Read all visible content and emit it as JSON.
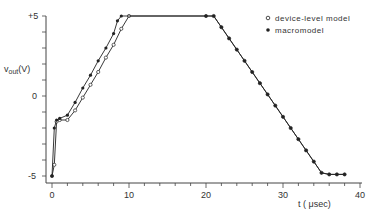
{
  "chart_data": {
    "type": "line",
    "title": "",
    "xlabel": "t (μsec)",
    "ylabel": "v_out(V)",
    "xlim": [
      0,
      40
    ],
    "ylim": [
      -5,
      5
    ],
    "x_ticks": [
      0,
      10,
      20,
      30,
      40
    ],
    "x_tick_labels": [
      "0",
      "10",
      "20",
      "30",
      "40"
    ],
    "y_ticks": [
      -5,
      0,
      5
    ],
    "y_tick_labels": [
      "-5",
      "0",
      "+5"
    ],
    "grid": false,
    "legend_position": "upper right",
    "series": [
      {
        "name": "device-level model",
        "marker": "open-circle",
        "x": [
          0,
          0.3,
          0.6,
          1,
          2,
          3,
          4,
          5,
          6,
          7,
          8,
          9,
          10,
          20,
          21,
          22,
          23,
          24,
          25,
          26,
          27,
          28,
          29,
          30,
          31,
          32,
          33,
          34,
          35,
          36,
          37,
          38
        ],
        "y": [
          -5,
          -4.3,
          -1.6,
          -1.5,
          -1.5,
          -0.9,
          -0.1,
          0.7,
          1.5,
          2.4,
          3.2,
          4.2,
          5,
          5,
          5,
          4.3,
          3.6,
          2.9,
          2.2,
          1.5,
          0.8,
          0.1,
          -0.6,
          -1.3,
          -2.0,
          -2.7,
          -3.4,
          -4.1,
          -4.8,
          -4.9,
          -4.9,
          -4.9
        ]
      },
      {
        "name": "macromodel",
        "marker": "filled-circle",
        "x": [
          0,
          0.3,
          0.6,
          1,
          2,
          3,
          4,
          5,
          6,
          7,
          8,
          8.5,
          9,
          20,
          21,
          22,
          23,
          24,
          25,
          26,
          27,
          28,
          29,
          30,
          31,
          32,
          33,
          34,
          35,
          36,
          37,
          38
        ],
        "y": [
          -5,
          -2.0,
          -1.5,
          -1.4,
          -1.2,
          -0.4,
          0.5,
          1.3,
          2.2,
          3.0,
          3.9,
          4.7,
          5,
          5,
          5,
          4.3,
          3.6,
          2.9,
          2.2,
          1.5,
          0.8,
          0.1,
          -0.6,
          -1.3,
          -2.0,
          -2.7,
          -3.4,
          -4.1,
          -4.8,
          -4.9,
          -4.9,
          -4.9
        ]
      }
    ],
    "legend": [
      "device-level model",
      "macromodel"
    ]
  },
  "colors": {
    "line": "#222222",
    "axis": "#444444",
    "background": "#ffffff"
  },
  "labels": {
    "ylabel_main": "v",
    "ylabel_sub": "out",
    "ylabel_unit": "(V)",
    "xlabel": "t ( μsec)",
    "legend_device": "device-level model",
    "legend_macro": "macromodel"
  }
}
